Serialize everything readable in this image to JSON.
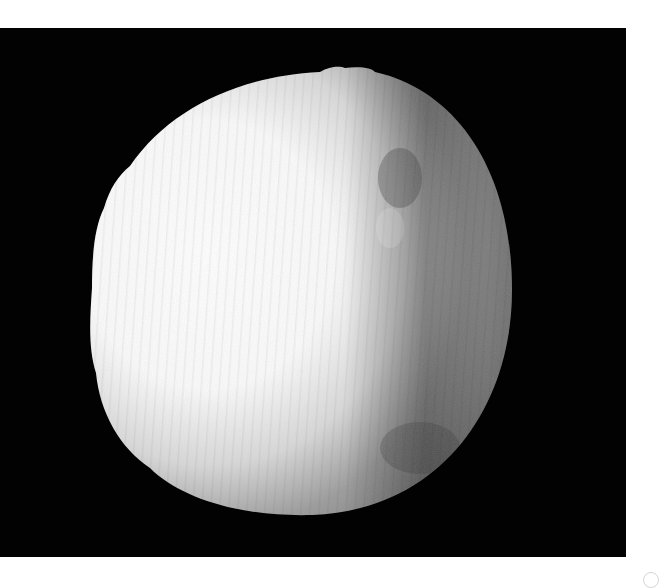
{
  "image": {
    "subject": "Irregular spherical moon-like body, brightly lit from the left, on a black background",
    "alt_text": "Grayscale photograph of a cratered spherical body illuminated from the left against a black sky"
  },
  "colors": {
    "background": "#020202",
    "lit_limb": "#ffffff",
    "mid_tone": "#bdbdbd",
    "shadow_side": "#7a7a7a",
    "terminator_dark": "#4a4a4a",
    "page": "#ffffff"
  },
  "icons": {
    "corner_mark": "circle-mark-icon"
  }
}
